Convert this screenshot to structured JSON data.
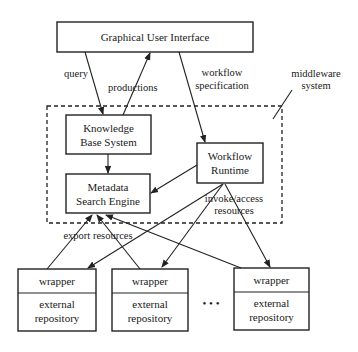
{
  "diagram": {
    "nodes": {
      "gui": {
        "label": "Graphical User Interface"
      },
      "kbs": {
        "line1": "Knowledge",
        "line2": "Base System"
      },
      "mse": {
        "line1": "Metadata",
        "line2": "Search Engine"
      },
      "wfr": {
        "line1": "Workflow",
        "line2": "Runtime"
      },
      "wrappers": [
        {
          "top": "wrapper",
          "bottom_line1": "external",
          "bottom_line2": "repository"
        },
        {
          "top": "wrapper",
          "bottom_line1": "external",
          "bottom_line2": "repository"
        },
        {
          "top": "wrapper",
          "bottom_line1": "external",
          "bottom_line2": "repository"
        }
      ],
      "ellipsis": "• • •"
    },
    "group": {
      "line1": "middleware",
      "line2": "system"
    },
    "edges": {
      "query": "query",
      "productions": "productions",
      "workflow_spec_line1": "workflow",
      "workflow_spec_line2": "specification",
      "invoke_line1": "invoke/access",
      "invoke_line2": "resources",
      "export": "export resources"
    },
    "colors": {
      "stroke": "#222222",
      "background": "#ffffff"
    }
  }
}
